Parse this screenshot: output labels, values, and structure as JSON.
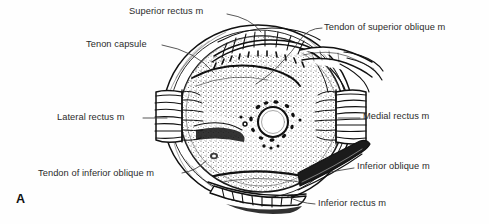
{
  "figure": {
    "panel_letter": "A",
    "view": "posterior view of right eye globe",
    "background_color": "#fefefe",
    "ink_color": "#111111",
    "text_color": "#2b2b2b",
    "width": 489,
    "height": 224
  },
  "labels": [
    {
      "id": "superior-rectus",
      "text": "Superior rectus m",
      "side": "top-left"
    },
    {
      "id": "tenon-capsule",
      "text": "Tenon capsule",
      "side": "left"
    },
    {
      "id": "lateral-rectus",
      "text": "Lateral rectus m",
      "side": "left"
    },
    {
      "id": "tendon-inferior-oblique",
      "text": "Tendon of inferior oblique m",
      "side": "bottom-left"
    },
    {
      "id": "tendon-superior-oblique",
      "text": "Tendon of superior oblique m",
      "side": "top-right"
    },
    {
      "id": "medial-rectus",
      "text": "Medial rectus m",
      "side": "right"
    },
    {
      "id": "inferior-oblique",
      "text": "Inferior oblique m",
      "side": "bottom-right"
    },
    {
      "id": "inferior-rectus",
      "text": "Inferior rectus m",
      "side": "bottom"
    }
  ],
  "structures": {
    "globe": "eyeball posterior surface with stippled sclera",
    "optic_nerve_head": "central pale disc ringed by short ciliary vessels",
    "tenon_capsule_edge": "reflected fascial capsule forming outer crescent",
    "muscle_stumps": [
      "lateral rectus",
      "medial rectus",
      "superior rectus",
      "inferior rectus"
    ],
    "oblique_tendons": [
      "superior oblique tendon",
      "inferior oblique muscle"
    ]
  }
}
